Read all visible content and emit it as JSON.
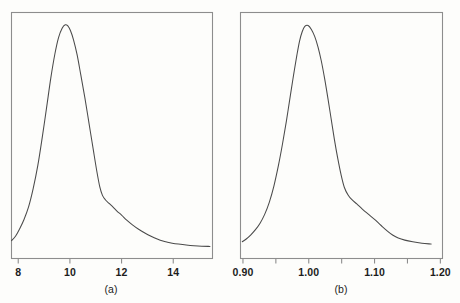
{
  "figure": {
    "background_color": "#fdfdfb",
    "frame_color": "#8d8d8d",
    "curve_color": "#4a4a4a",
    "label_color": "#1c1c1c"
  },
  "panels": [
    {
      "id": "a",
      "caption": "(a)",
      "caption_x": 111,
      "frame": {
        "x": 11,
        "y": 12,
        "w": 201,
        "h": 246
      },
      "tick_labels": [
        "8",
        "10",
        "12",
        "14"
      ]
    },
    {
      "id": "b",
      "caption": "(b)",
      "caption_x": 341,
      "frame": {
        "x": 240,
        "y": 12,
        "w": 202,
        "h": 246
      },
      "tick_labels": [
        "0.90",
        "1.00",
        "1.10",
        "1.20"
      ]
    }
  ],
  "chart_data": [
    {
      "type": "line",
      "panel": "a",
      "title": "",
      "subtitle": "",
      "xlabel": "(a)",
      "ylabel": "",
      "grid": false,
      "legend": "none",
      "axis_box": true,
      "xlim": [
        7.72,
        15.5
      ],
      "ylim": [
        0,
        1.06
      ],
      "xticks": [
        8,
        10,
        12,
        14
      ],
      "xticklabels": [
        "8",
        "10",
        "12",
        "14"
      ],
      "yticks": [],
      "yticklabels": [],
      "x": [
        7.74,
        7.9,
        8.05,
        8.22,
        8.4,
        8.58,
        8.76,
        8.93,
        9.1,
        9.26,
        9.42,
        9.56,
        9.7,
        9.82,
        9.92,
        10.02,
        10.14,
        10.28,
        10.42,
        10.58,
        10.74,
        10.9,
        11.04,
        11.16,
        11.26,
        11.38,
        11.52,
        11.68,
        11.84,
        12.0,
        12.2,
        12.42,
        12.66,
        12.9,
        13.14,
        13.38,
        13.6,
        13.78,
        13.96,
        14.2,
        14.5,
        14.8,
        15.1,
        15.42
      ],
      "y": [
        0.075,
        0.095,
        0.125,
        0.165,
        0.22,
        0.3,
        0.4,
        0.52,
        0.65,
        0.775,
        0.88,
        0.95,
        0.99,
        1.005,
        1.0,
        0.98,
        0.94,
        0.875,
        0.79,
        0.69,
        0.58,
        0.47,
        0.375,
        0.305,
        0.27,
        0.25,
        0.235,
        0.218,
        0.2,
        0.185,
        0.163,
        0.143,
        0.124,
        0.108,
        0.094,
        0.082,
        0.073,
        0.068,
        0.064,
        0.06,
        0.056,
        0.053,
        0.051,
        0.05
      ],
      "description": "Right-skewed unimodal density peaking near 9.9, with a shoulder kink near 11.3 and a long flat right tail."
    },
    {
      "type": "line",
      "panel": "b",
      "title": "",
      "subtitle": "",
      "xlabel": "(b)",
      "ylabel": "",
      "grid": false,
      "legend": "none",
      "axis_box": true,
      "xlim": [
        0.8955,
        1.2025
      ],
      "ylim": [
        0,
        1.06
      ],
      "xticks": [
        0.9,
        0.95,
        1.0,
        1.05,
        1.1,
        1.15,
        1.2
      ],
      "xticklabels": [
        "0.90",
        "",
        "1.00",
        "",
        "1.10",
        "",
        "1.20"
      ],
      "major_xticks": [
        0.9,
        1.0,
        1.1,
        1.2
      ],
      "yticks": [],
      "yticklabels": [],
      "x": [
        0.899,
        0.905,
        0.912,
        0.919,
        0.926,
        0.933,
        0.94,
        0.947,
        0.954,
        0.96,
        0.966,
        0.972,
        0.977,
        0.982,
        0.986,
        0.99,
        0.994,
        0.999,
        1.004,
        1.009,
        1.014,
        1.019,
        1.024,
        1.029,
        1.034,
        1.039,
        1.044,
        1.049,
        1.054,
        1.06,
        1.066,
        1.073,
        1.081,
        1.09,
        1.1,
        1.11,
        1.12,
        1.128,
        1.136,
        1.146,
        1.158,
        1.172,
        1.186
      ],
      "y": [
        0.07,
        0.082,
        0.1,
        0.122,
        0.15,
        0.188,
        0.24,
        0.31,
        0.4,
        0.49,
        0.59,
        0.7,
        0.79,
        0.875,
        0.935,
        0.975,
        0.998,
        1.002,
        0.985,
        0.955,
        0.91,
        0.85,
        0.775,
        0.69,
        0.6,
        0.51,
        0.43,
        0.36,
        0.305,
        0.27,
        0.25,
        0.233,
        0.212,
        0.19,
        0.166,
        0.14,
        0.115,
        0.098,
        0.086,
        0.077,
        0.07,
        0.064,
        0.06
      ],
      "description": "Right-skewed unimodal density peaking near 1.00, with a shoulder kink near 1.06 and a long flat right tail extending to 1.19."
    }
  ]
}
